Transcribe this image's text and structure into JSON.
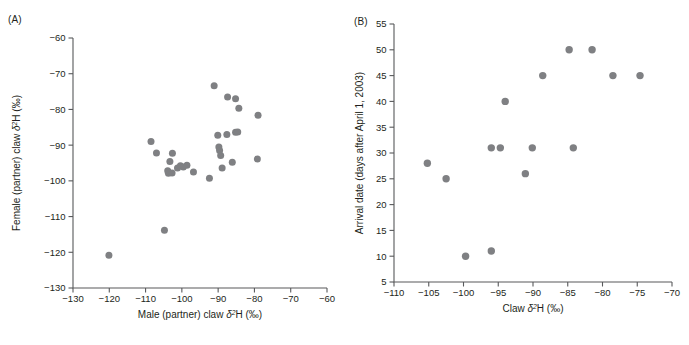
{
  "figure": {
    "background": "#ffffff",
    "point_color": "#7f8083",
    "axis_color": "#58595b",
    "text_color": "#231f20"
  },
  "panels": [
    {
      "id": "A",
      "label": "(A)",
      "xlabel_parts": {
        "pre": "Male (partner) claw ",
        "delta": "δ",
        "sup": "2",
        "post": "H (‰)"
      },
      "xlabel": "Male (partner) claw δ2H (‰)",
      "ylabel_parts": {
        "pre": "Female (partner) claw ",
        "delta": "δ",
        "sup": "2",
        "post": "H (‰)"
      },
      "ylabel": "Female (partner) claw δ2H (‰)",
      "xticks": [
        -130,
        -120,
        -110,
        -100,
        -90,
        -80,
        -70,
        -60
      ],
      "xticklabels": [
        "−130",
        "−120",
        "−110",
        "−100",
        "−90",
        "−80",
        "−70",
        "−60"
      ],
      "yticks": [
        -130,
        -120,
        -110,
        -100,
        -90,
        -80,
        -70,
        -60
      ],
      "yticklabels": [
        "−130",
        "−120",
        "−110",
        "−100",
        "−90",
        "−80",
        "−70",
        "−60"
      ],
      "xlim": [
        -130,
        -60
      ],
      "ylim": [
        -130,
        -60
      ]
    },
    {
      "id": "B",
      "label": "(B)",
      "xlabel_parts": {
        "pre": "Claw ",
        "delta": "δ",
        "sup": "2",
        "post": "H (‰)"
      },
      "xlabel": "Claw δ2H (‰)",
      "ylabel_parts": {
        "pre": "Arrival date (days after April 1, 2003)",
        "delta": "",
        "sup": "",
        "post": ""
      },
      "ylabel": "Arrival date (days after April 1, 2003)",
      "xticks": [
        -110,
        -105,
        -100,
        -95,
        -90,
        -85,
        -80,
        -75,
        -70
      ],
      "xticklabels": [
        "−110",
        "−105",
        "−100",
        "−95",
        "−90",
        "−85",
        "−80",
        "−75",
        "−70"
      ],
      "yticks": [
        5,
        10,
        15,
        20,
        25,
        30,
        35,
        40,
        45,
        50,
        55
      ],
      "yticklabels": [
        "5",
        "10",
        "15",
        "20",
        "25",
        "30",
        "35",
        "40",
        "45",
        "50",
        "55"
      ],
      "xlim": [
        -110,
        -70
      ],
      "ylim": [
        5,
        55
      ]
    }
  ],
  "chart_data": [
    {
      "panel": "A",
      "type": "scatter",
      "title": "",
      "xlabel": "Male (partner) claw δ2H (‰)",
      "ylabel": "Female (partner) claw δ2H (‰)",
      "xlim": [
        -130,
        -60
      ],
      "ylim": [
        -130,
        -60
      ],
      "grid": false,
      "legend": "none",
      "marker": {
        "shape": "circle",
        "color": "#7f8083",
        "size": 5
      },
      "points": [
        {
          "x": -120.1,
          "y": -120.8
        },
        {
          "x": -104.8,
          "y": -113.8
        },
        {
          "x": -108.5,
          "y": -89.0
        },
        {
          "x": -107.0,
          "y": -92.2
        },
        {
          "x": -102.6,
          "y": -92.3
        },
        {
          "x": -103.3,
          "y": -94.6
        },
        {
          "x": -103.9,
          "y": -97.2
        },
        {
          "x": -103.7,
          "y": -97.9
        },
        {
          "x": -102.7,
          "y": -97.8
        },
        {
          "x": -101.2,
          "y": -96.4
        },
        {
          "x": -100.4,
          "y": -95.8
        },
        {
          "x": -99.6,
          "y": -96.1
        },
        {
          "x": -98.6,
          "y": -95.6
        },
        {
          "x": -96.8,
          "y": -97.5
        },
        {
          "x": -92.4,
          "y": -99.3
        },
        {
          "x": -91.1,
          "y": -73.4
        },
        {
          "x": -87.4,
          "y": -76.5
        },
        {
          "x": -85.2,
          "y": -77.0
        },
        {
          "x": -84.3,
          "y": -79.7
        },
        {
          "x": -79.0,
          "y": -81.6
        },
        {
          "x": -90.1,
          "y": -87.2
        },
        {
          "x": -87.6,
          "y": -87.0
        },
        {
          "x": -85.2,
          "y": -86.4
        },
        {
          "x": -84.6,
          "y": -86.3
        },
        {
          "x": -89.8,
          "y": -90.5
        },
        {
          "x": -89.6,
          "y": -91.5
        },
        {
          "x": -89.3,
          "y": -92.9
        },
        {
          "x": -88.9,
          "y": -96.4
        },
        {
          "x": -86.1,
          "y": -94.8
        },
        {
          "x": -79.2,
          "y": -93.9
        }
      ]
    },
    {
      "panel": "B",
      "type": "scatter",
      "title": "",
      "xlabel": "Claw δ2H (‰)",
      "ylabel": "Arrival date (days after April 1, 2003)",
      "xlim": [
        -110,
        -70
      ],
      "ylim": [
        5,
        55
      ],
      "grid": false,
      "legend": "none",
      "marker": {
        "shape": "circle",
        "color": "#7f8083",
        "size": 6
      },
      "points": [
        {
          "x": -105.2,
          "y": 28
        },
        {
          "x": -102.5,
          "y": 25
        },
        {
          "x": -99.7,
          "y": 10
        },
        {
          "x": -96.0,
          "y": 11
        },
        {
          "x": -96.0,
          "y": 31
        },
        {
          "x": -94.7,
          "y": 31
        },
        {
          "x": -94.0,
          "y": 40
        },
        {
          "x": -91.1,
          "y": 26
        },
        {
          "x": -90.1,
          "y": 31
        },
        {
          "x": -88.6,
          "y": 45
        },
        {
          "x": -84.8,
          "y": 50
        },
        {
          "x": -84.2,
          "y": 31
        },
        {
          "x": -81.5,
          "y": 50
        },
        {
          "x": -78.5,
          "y": 45
        },
        {
          "x": -74.6,
          "y": 45
        }
      ]
    }
  ]
}
